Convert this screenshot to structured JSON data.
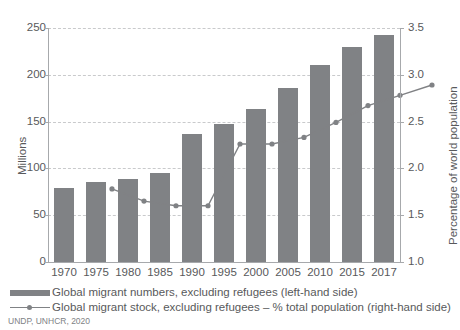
{
  "chart_data": {
    "type": "bar",
    "title": "",
    "categories": [
      "1970",
      "1975",
      "1980",
      "1985",
      "1990",
      "1995",
      "2000",
      "2005",
      "2010",
      "2015",
      "2017"
    ],
    "series": [
      {
        "name": "Global migrant numbers, excluding refugees (left-hand side)",
        "type": "bar",
        "axis": "left",
        "unit": "Millions",
        "color": "#808285",
        "values": [
          79,
          85,
          89,
          95,
          137,
          147,
          163,
          186,
          211,
          230,
          243
        ]
      },
      {
        "name": "Global migrant stock, excluding refugees – % total population (right-hand side)",
        "type": "line",
        "axis": "right",
        "unit": "%",
        "color": "#808285",
        "values": [
          2.08,
          1.95,
          1.9,
          1.9,
          2.56,
          2.56,
          2.63,
          2.79,
          2.97,
          3.08,
          3.19
        ]
      }
    ],
    "xlabel": "",
    "ylabel_left": "Millions",
    "ylabel_right": "Percentage of world population",
    "ylim_left": [
      0,
      250
    ],
    "ylim_right": [
      1.0,
      3.5
    ],
    "yticks_left": [
      "0",
      "50",
      "100",
      "150",
      "200",
      "250"
    ],
    "yticks_right": [
      "1.0",
      "1.5",
      "2.0",
      "2.5",
      "3.0",
      "3.5"
    ],
    "grid": true,
    "grid_style": "dashed",
    "legend_position": "bottom-left",
    "source": "UNDP, UNHCR, 2020"
  },
  "axes": {
    "left": {
      "title": "Millions",
      "ticks": [
        "0",
        "50",
        "100",
        "150",
        "200",
        "250"
      ]
    },
    "right": {
      "title": "Percentage of world population",
      "ticks": [
        "1.0",
        "1.5",
        "2.0",
        "2.5",
        "3.0",
        "3.5"
      ]
    },
    "x": {
      "ticks": [
        "1970",
        "1975",
        "1980",
        "1985",
        "1990",
        "1995",
        "2000",
        "2005",
        "2010",
        "2015",
        "2017"
      ]
    }
  },
  "legend": {
    "items": [
      {
        "label": "Global migrant numbers, excluding refugees (left-hand side)",
        "marker": "bar-swatch",
        "color": "#808285"
      },
      {
        "label": "Global migrant stock, excluding refugees – % total population (right-hand side)",
        "marker": "line-marker-swatch",
        "color": "#808285"
      }
    ]
  },
  "source": "UNDP, UNHCR, 2020",
  "colors": {
    "bar": "#808285",
    "line": "#808285",
    "grid": "#c9cacc",
    "axis": "#a7a9ac",
    "text": "#58595b"
  }
}
